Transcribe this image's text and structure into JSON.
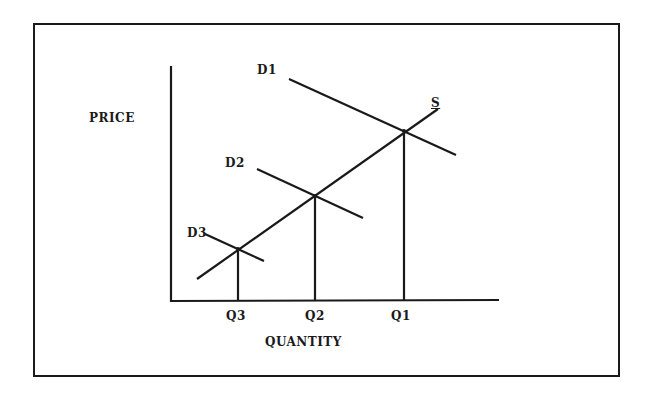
{
  "diagram": {
    "type": "supply-demand",
    "axis_labels": {
      "y": "PRICE",
      "x": "QUANTITY"
    },
    "curves": {
      "supply": {
        "label": "S"
      },
      "demand": [
        {
          "label": "D1"
        },
        {
          "label": "D2"
        },
        {
          "label": "D3"
        }
      ]
    },
    "quantity_ticks": [
      "Q3",
      "Q2",
      "Q1"
    ],
    "colors": {
      "ink": "#1a1a1a",
      "background": "#ffffff"
    }
  }
}
